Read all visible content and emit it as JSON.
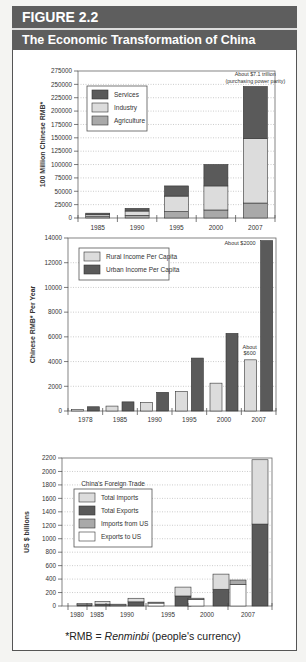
{
  "header": {
    "figure_label": "FIGURE 2.2",
    "title": "The Economic Transformation of China"
  },
  "footnote": {
    "prefix": "*RMB = ",
    "term": "Renminbi",
    "suffix": " (people's currency)"
  },
  "colors": {
    "dark": "#5a5a5a",
    "light": "#dcdcdc",
    "medium": "#a9a9a9",
    "white": "#ffffff",
    "header_bg": "#5e5e5e"
  },
  "chart_data": [
    {
      "type": "bar",
      "stacked": true,
      "title": "",
      "xlabel": "",
      "ylabel": "100 Million Chinese RMB*",
      "ylim": [
        0,
        275000
      ],
      "yticks": [
        0,
        25000,
        50000,
        75000,
        100000,
        125000,
        150000,
        175000,
        200000,
        225000,
        250000,
        275000
      ],
      "categories": [
        "1985",
        "1990",
        "1995",
        "2000",
        "2007"
      ],
      "series": [
        {
          "name": "Agriculture",
          "color": "#a9a9a9",
          "values": [
            2500,
            5000,
            12000,
            15000,
            28000
          ]
        },
        {
          "name": "Industry",
          "color": "#dcdcdc",
          "values": [
            3500,
            8000,
            29000,
            45000,
            121000
          ]
        },
        {
          "name": "Services",
          "color": "#5a5a5a",
          "values": [
            3000,
            5000,
            19000,
            40000,
            97000
          ]
        }
      ],
      "legend": {
        "entries": [
          "Services",
          "Industry",
          "Agriculture"
        ],
        "position": "upper-left"
      },
      "annotations": [
        {
          "category": "2007",
          "text": [
            "About $7.1 trillion",
            "(purchasing power parity)"
          ]
        }
      ],
      "grid": "horizontal-dotted"
    },
    {
      "type": "bar",
      "stacked": false,
      "title": "",
      "xlabel": "",
      "ylabel": "Chinese RMB* Per Year",
      "ylim": [
        0,
        14000
      ],
      "yticks": [
        0,
        2000,
        4000,
        6000,
        8000,
        10000,
        12000,
        14000
      ],
      "categories": [
        "1978",
        "1985",
        "1990",
        "1995",
        "2000",
        "2007"
      ],
      "series": [
        {
          "name": "Rural Income Per Capita",
          "color": "#dcdcdc",
          "values": [
            134,
            398,
            686,
            1578,
            2253,
            4140
          ]
        },
        {
          "name": "Urban Income Per Capita",
          "color": "#5a5a5a",
          "values": [
            343,
            739,
            1510,
            4283,
            6280,
            13786
          ]
        }
      ],
      "legend": {
        "entries": [
          "Rural Income Per Capita",
          "Urban Income Per Capita"
        ],
        "position": "upper-left"
      },
      "annotations": [
        {
          "category": "2007",
          "series": "Urban Income Per Capita",
          "text": [
            "About $2000"
          ]
        },
        {
          "category": "2007",
          "series": "Rural Income Per Capita",
          "text": [
            "About",
            "$600"
          ]
        }
      ],
      "grid": "horizontal-dotted"
    },
    {
      "type": "bar",
      "stacked": true,
      "title": "China's Foreign Trade",
      "xlabel": "",
      "ylabel": "US $ billions",
      "ylim": [
        0,
        2200
      ],
      "yticks": [
        0,
        200,
        400,
        600,
        800,
        1000,
        1200,
        1400,
        1600,
        1800,
        2000,
        2200
      ],
      "categories": [
        "1980",
        "1985",
        "1990",
        "1995",
        "2000",
        "2007"
      ],
      "groups": [
        {
          "year": "1980",
          "bars": [
            {
              "label": "US trade",
              "segments": [
                {
                  "name": "Exports to US",
                  "value": 0
                },
                {
                  "name": "Imports from US",
                  "value": 0
                }
              ]
            },
            {
              "label": "Total trade",
              "segments": [
                {
                  "name": "Total Exports",
                  "value": 18
                },
                {
                  "name": "Total Imports",
                  "value": 20
                }
              ]
            }
          ]
        },
        {
          "year": "1985",
          "bars": [
            {
              "label": "Total trade",
              "segments": [
                {
                  "name": "Total Exports",
                  "value": 27
                },
                {
                  "name": "Total Imports",
                  "value": 42
                }
              ]
            }
          ]
        },
        {
          "year": "1990",
          "bars": [
            {
              "label": "US trade",
              "segments": [
                {
                  "name": "Exports to US",
                  "value": 15
                },
                {
                  "name": "Imports from US",
                  "value": 12
                }
              ]
            },
            {
              "label": "Total trade",
              "segments": [
                {
                  "name": "Total Exports",
                  "value": 62
                },
                {
                  "name": "Total Imports",
                  "value": 53
                }
              ]
            }
          ]
        },
        {
          "year": "1995",
          "bars": [
            {
              "label": "US trade",
              "segments": [
                {
                  "name": "Exports to US",
                  "value": 45
                },
                {
                  "name": "Imports from US",
                  "value": 12
                }
              ]
            },
            {
              "label": "Total trade",
              "segments": [
                {
                  "name": "Total Exports",
                  "value": 149
                },
                {
                  "name": "Total Imports",
                  "value": 132
                }
              ]
            }
          ]
        },
        {
          "year": "2000",
          "bars": [
            {
              "label": "US trade",
              "segments": [
                {
                  "name": "Exports to US",
                  "value": 100
                },
                {
                  "name": "Imports from US",
                  "value": 16
                }
              ]
            },
            {
              "label": "Total trade",
              "segments": [
                {
                  "name": "Total Exports",
                  "value": 249
                },
                {
                  "name": "Total Imports",
                  "value": 225
                }
              ]
            }
          ]
        },
        {
          "year": "2007",
          "bars": [
            {
              "label": "US trade",
              "segments": [
                {
                  "name": "Exports to US",
                  "value": 321
                },
                {
                  "name": "Imports from US",
                  "value": 65
                }
              ]
            },
            {
              "label": "Total trade",
              "segments": [
                {
                  "name": "Total Exports",
                  "value": 1218
                },
                {
                  "name": "Total Imports",
                  "value": 956
                }
              ]
            }
          ]
        }
      ],
      "series": [
        {
          "name": "Total Imports",
          "color": "#dcdcdc"
        },
        {
          "name": "Total Exports",
          "color": "#5a5a5a"
        },
        {
          "name": "Imports from US",
          "color": "#a9a9a9"
        },
        {
          "name": "Exports to US",
          "color": "#ffffff"
        }
      ],
      "legend": {
        "title": "China's Foreign Trade",
        "entries": [
          "Total Imports",
          "Total Exports",
          "Imports from US",
          "Exports to US"
        ],
        "position": "upper-left"
      },
      "grid": "horizontal-dotted"
    }
  ]
}
